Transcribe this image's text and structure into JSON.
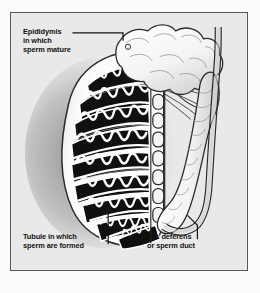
{
  "figure": {
    "frame_color": "#585858",
    "background_color": "#e9e9e9",
    "outer_margin_color": "#fbfbfb"
  },
  "labels": {
    "epididymis": {
      "text": "Epididymis\nin which\nsperm mature",
      "line1": "Epididymis",
      "line2": "in which",
      "line3": "sperm mature"
    },
    "tubule": {
      "text": "Tubule in which\nsperm are formed",
      "line1": "Tubule in which",
      "line2": "sperm are formed"
    },
    "vas_deferens": {
      "text": "Vas deferens\nor sperm duct",
      "line1": "Vas deferens",
      "line2": "or sperm duct"
    }
  },
  "anatomy": {
    "testis_label": "testis-body",
    "lobule_count": 9,
    "rete_testis_segments": 9,
    "efferent_ductule_count": 8,
    "colors": {
      "tubule_fill": "#101010",
      "tubule_outline": "#ffffff",
      "septa": "#ffffff",
      "tunica": "#f7f7f7",
      "shadow": "#9a9a9a",
      "epididymis_fill": "#fdfdfd",
      "vas_fill": "#fcfcfc",
      "ink": "#1a1a1a"
    }
  },
  "leader_lines": {
    "epididymis": "horizontal line from caption to epididymis head",
    "tubule": "vertical line from caption up into a lobule",
    "vas_deferens": "elbow line from caption up to the vas deferens tube"
  }
}
